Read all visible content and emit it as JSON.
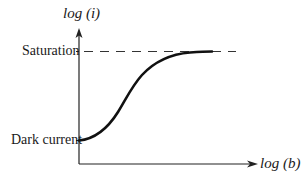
{
  "diagram": {
    "type": "sigmoid-response-curve",
    "y_axis_label": "log (i)",
    "x_axis_label": "log (b)",
    "annotations": {
      "top_level": "Saturation",
      "bottom_level": "Dark current"
    },
    "colors": {
      "line": "#111111",
      "background": "#ffffff"
    }
  }
}
